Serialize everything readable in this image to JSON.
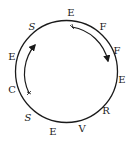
{
  "diagram": {
    "type": "letter-circle-puzzle",
    "reading_direction": "clockwise",
    "circle": {
      "cx": 66.5,
      "cy": 71.5,
      "r": 51,
      "stroke": "#1a1a1a"
    },
    "letters": [
      {
        "char": "E",
        "x": 71,
        "y": 13
      },
      {
        "char": "F",
        "x": 103,
        "y": 27
      },
      {
        "char": "F",
        "x": 117,
        "y": 51
      },
      {
        "char": "E",
        "x": 122,
        "y": 80
      },
      {
        "char": "R",
        "x": 106,
        "y": 111
      },
      {
        "char": "V",
        "x": 82,
        "y": 129
      },
      {
        "char": "E",
        "x": 53,
        "y": 132
      },
      {
        "char": "S",
        "x": 28,
        "y": 118
      },
      {
        "char": "C",
        "x": 12,
        "y": 90
      },
      {
        "char": "E",
        "x": 12,
        "y": 57
      },
      {
        "char": "S",
        "x": 32,
        "y": 27
      }
    ],
    "arrows": [
      {
        "name": "clockwise-arrow-right",
        "path": "M 72 27 A 44 44 0 0 1 108 61",
        "direction": "clockwise"
      },
      {
        "name": "clockwise-arrow-left",
        "path": "M 29 93 A 44 44 0 0 1 35 45",
        "direction": "clockwise"
      }
    ]
  }
}
